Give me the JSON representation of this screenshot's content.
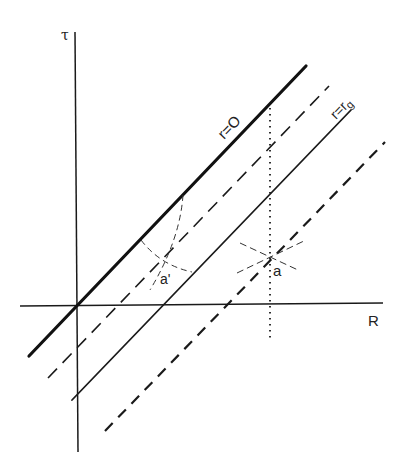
{
  "diagram": {
    "type": "spacetime-diagram",
    "axes": {
      "vertical_label": "τ",
      "horizontal_label": "R"
    },
    "lines": [
      {
        "id": "r0",
        "label": "r=O",
        "style": "thick-solid"
      },
      {
        "id": "dashed-inner",
        "label": "",
        "style": "long-dash"
      },
      {
        "id": "rg",
        "label": "r=r_g",
        "label_main": "r=r",
        "label_sub": "g",
        "style": "solid"
      },
      {
        "id": "dashed-outer",
        "label": "",
        "style": "bold-dash"
      },
      {
        "id": "vertical-dotted",
        "label": "",
        "style": "dotted"
      }
    ],
    "points": [
      {
        "label": "a'",
        "description": "light-cone crossing between r=0 and r=r_g"
      },
      {
        "label": "a",
        "description": "light-cone crossing outside r=r_g on dotted line"
      }
    ],
    "colors": {
      "ink": "#1a1a1a",
      "background": "#ffffff"
    }
  }
}
